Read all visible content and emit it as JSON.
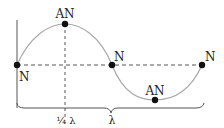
{
  "diagram": {
    "labels": {
      "node_left": "N",
      "node_middle": "N",
      "node_right": "N",
      "antinode_top": "AN",
      "antinode_bottom": "AN",
      "quarter_wavelength": "¼ λ",
      "wavelength": "λ"
    },
    "colors": {
      "wave": "#a8a8a8",
      "dashed": "#555555",
      "dot": "#111111",
      "axis": "#555555",
      "text": "#222222"
    }
  }
}
